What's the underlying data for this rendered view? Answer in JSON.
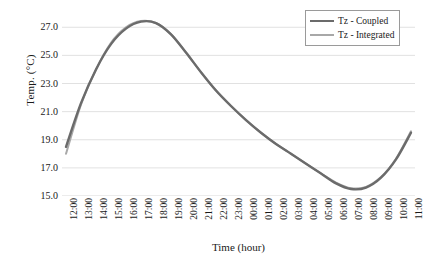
{
  "chart_data": {
    "type": "line",
    "title": "",
    "xlabel": "Time (hour)",
    "ylabel": "Temp. (°C)",
    "ylim": [
      15.0,
      27.8
    ],
    "yticks": [
      "15.0",
      "17.0",
      "19.0",
      "21.0",
      "23.0",
      "25.0",
      "27.0"
    ],
    "ytick_values": [
      15.0,
      17.0,
      19.0,
      21.0,
      23.0,
      25.0,
      27.0
    ],
    "grid": "horizontal",
    "legend_position": "top-right",
    "x": [
      "12:00",
      "13:00",
      "14:00",
      "15:00",
      "16:00",
      "17:00",
      "18:00",
      "19:00",
      "20:00",
      "21:00",
      "22:00",
      "23:00",
      "00:00",
      "01:00",
      "02:00",
      "03:00",
      "04:00",
      "05:00",
      "06:00",
      "07:00",
      "08:00",
      "09:00",
      "10:00",
      "11:00"
    ],
    "categories": [
      "12:00",
      "13:00",
      "14:00",
      "15:00",
      "16:00",
      "17:00",
      "18:00",
      "19:00",
      "20:00",
      "21:00",
      "22:00",
      "23:00",
      "00:00",
      "01:00",
      "02:00",
      "03:00",
      "04:00",
      "05:00",
      "06:00",
      "07:00",
      "08:00",
      "09:00",
      "10:00",
      "11:00"
    ],
    "series": [
      {
        "name": "Tz - Coupled",
        "color": "#6b6b6b",
        "values": [
          18.5,
          21.6,
          24.0,
          25.8,
          26.9,
          27.4,
          27.3,
          26.5,
          25.2,
          23.8,
          22.5,
          21.4,
          20.4,
          19.5,
          18.7,
          18.0,
          17.3,
          16.6,
          15.9,
          15.5,
          15.6,
          16.3,
          17.6,
          19.5
        ]
      },
      {
        "name": "Tz - Integrated",
        "color": "#a8a8a8",
        "values": [
          18.0,
          21.5,
          24.0,
          25.9,
          27.0,
          27.45,
          27.3,
          26.5,
          25.2,
          23.8,
          22.5,
          21.4,
          20.4,
          19.5,
          18.7,
          18.0,
          17.3,
          16.6,
          15.95,
          15.55,
          15.65,
          16.35,
          17.65,
          19.6
        ]
      }
    ]
  },
  "legend": {
    "items": [
      {
        "label": "Tz - Coupled",
        "color": "#6b6b6b",
        "width": 2.6
      },
      {
        "label": "Tz - Integrated",
        "color": "#a8a8a8",
        "width": 2.2
      }
    ]
  },
  "axes": {
    "x_title": "Time (hour)",
    "y_title": "Temp. (°C)"
  },
  "colors": {
    "gridline": "#d9d9d9",
    "axis": "#b0b0b0",
    "text": "#1a1a1a",
    "legend_border": "#9a9a9a",
    "background": "#ffffff"
  }
}
